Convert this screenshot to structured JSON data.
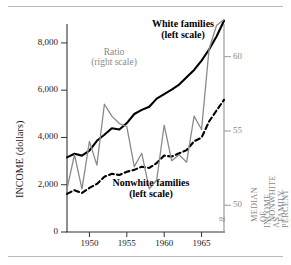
{
  "chart_data": {
    "type": "line",
    "title": "",
    "xlabel": "",
    "ylabel": "INCOME (dollars)",
    "ylabel_right": "MEDIAN OF NONWHITE FAMILY INCOME AS PERCENT OF WHITE",
    "xlim": [
      1947,
      1968
    ],
    "ylim": [
      0,
      8800
    ],
    "ylim_right": [
      48.2,
      62.2
    ],
    "grid": false,
    "legend_position": "inline-annotations",
    "xticks": [
      1950,
      1955,
      1960,
      1965
    ],
    "xtick_labels": [
      "1950",
      "1955",
      "1960",
      "1965"
    ],
    "yticks": [
      0,
      2000,
      4000,
      6000,
      8000
    ],
    "ytick_labels": [
      "0",
      "2,000",
      "4,000",
      "6,000",
      "8,000"
    ],
    "yticks_right": [
      50,
      55,
      60
    ],
    "ytick_labels_right": [
      "50",
      "55",
      "60"
    ],
    "axis_break_symbol": "≈",
    "x": [
      1947,
      1948,
      1949,
      1950,
      1951,
      1952,
      1953,
      1954,
      1955,
      1956,
      1957,
      1958,
      1959,
      1960,
      1961,
      1962,
      1963,
      1964,
      1965,
      1966,
      1967,
      1968
    ],
    "series": [
      {
        "name": "White families",
        "annotation": "White families",
        "annotation_sub": "(left scale)",
        "scale": "left",
        "style": "solid",
        "color": "#000000",
        "values": [
          3157,
          3310,
          3232,
          3445,
          3859,
          4114,
          4392,
          4339,
          4605,
          4993,
          5166,
          5300,
          5643,
          5835,
          6027,
          6237,
          6548,
          6858,
          7251,
          7722,
          8274,
          8937
        ]
      },
      {
        "name": "Nonwhite families",
        "annotation": "Nonwhite families",
        "annotation_sub": "(left scale)",
        "scale": "left",
        "style": "dashed",
        "color": "#000000",
        "values": [
          1614,
          1768,
          1650,
          1869,
          2032,
          2338,
          2461,
          2410,
          2549,
          2628,
          2764,
          2711,
          2917,
          3233,
          3191,
          3330,
          3465,
          3839,
          3994,
          4674,
          5141,
          5590
        ]
      },
      {
        "name": "Ratio",
        "annotation": "Ratio",
        "annotation_sub": "(right scale)",
        "scale": "right",
        "style": "solid",
        "color": "#8a8a8a",
        "values": [
          51.1,
          53.4,
          51.1,
          54.3,
          52.7,
          56.8,
          56.0,
          55.5,
          55.3,
          52.6,
          53.5,
          51.1,
          51.7,
          55.4,
          53.0,
          53.4,
          52.9,
          56.0,
          55.1,
          60.5,
          62.1,
          62.5
        ]
      }
    ]
  }
}
